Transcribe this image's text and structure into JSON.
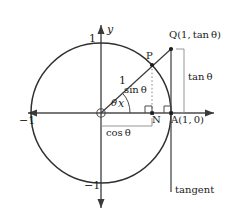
{
  "figure": {
    "stroke_color": "#3a3a3a",
    "text_color": "#1c1c1c",
    "background": "#ffffff",
    "geometry": {
      "origin_x": 101,
      "origin_y": 113,
      "radius_px": 70,
      "theta_degrees": 43,
      "point_P_x": 152,
      "point_P_y": 65,
      "point_Q_x": 171,
      "point_Q_y": 49,
      "point_N_x": 152,
      "point_A_x": 171,
      "tangent_bottom_y": 192
    },
    "axes": {
      "x_label": "x",
      "y_label": "y",
      "x_min_tick": "−1",
      "y_max_tick": "1",
      "y_min_tick": "−1"
    },
    "labels": {
      "point_P": "P",
      "point_N": "N",
      "point_A": "A(1, 0)",
      "point_Q": "Q(1, tan θ)",
      "radius": "1",
      "angle": "θ",
      "sin": "sin θ",
      "cos": "cos θ",
      "tan": "tan θ",
      "tangent_line": "tangent"
    }
  }
}
